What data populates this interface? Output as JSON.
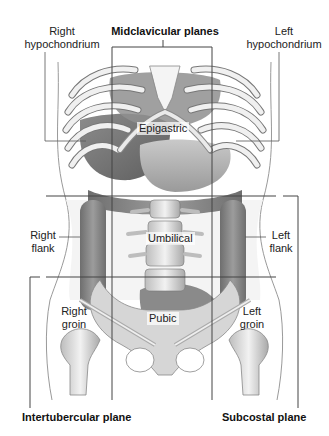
{
  "figure": {
    "title_labels": {
      "midclavicular": "Midclavicular planes",
      "intertubercular": "Intertubercular plane",
      "subcostal": "Subcostal plane"
    },
    "regions": {
      "right_hypochondrium": [
        "Right",
        "hypochondrium"
      ],
      "left_hypochondrium": [
        "Left",
        "hypochondrium"
      ],
      "epigastric": "Epigastric",
      "right_flank": [
        "Right",
        "flank"
      ],
      "umbilical": "Umbilical",
      "left_flank": [
        "Left",
        "flank"
      ],
      "right_groin": [
        "Right",
        "groin"
      ],
      "pubic": "Pubic",
      "left_groin": [
        "Left",
        "groin"
      ]
    },
    "planes": {
      "vertical_x": [
        112,
        212
      ],
      "horizontal_y": [
        196,
        277
      ]
    },
    "colors": {
      "line": "#555555",
      "plane_line": "#444444",
      "bone": "#e8e8e8",
      "organ_dark": "#7a7a7a",
      "organ_mid": "#a8a8a8",
      "skin_outline": "#9a9a9a"
    }
  }
}
